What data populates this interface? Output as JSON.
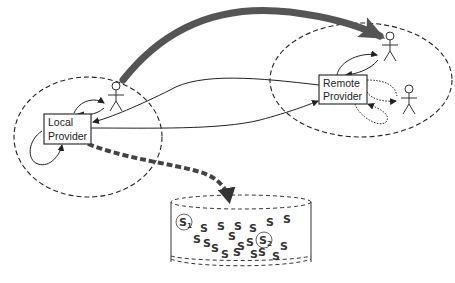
{
  "diagram": {
    "type": "provider-architecture",
    "nodes": {
      "local_provider": {
        "label_line1": "Local",
        "label_line2": "Provider"
      },
      "remote_provider": {
        "label_line1": "Remote",
        "label_line2": "Provider"
      }
    },
    "storage": {
      "shape": "cylinder",
      "highlighted_items": [
        {
          "label": "S",
          "subscript": "1"
        },
        {
          "label": "S",
          "subscript": "2"
        }
      ],
      "item_glyph": "S"
    },
    "actors": [
      {
        "id": "user-local",
        "icon": "person-icon"
      },
      {
        "id": "user-remote-1",
        "icon": "person-icon"
      },
      {
        "id": "user-remote-2",
        "icon": "person-icon"
      }
    ],
    "colors": {
      "stroke": "#222222",
      "big_arrow": "#555555",
      "dashed_arrow": "#444444",
      "background": "#ffffff"
    }
  }
}
